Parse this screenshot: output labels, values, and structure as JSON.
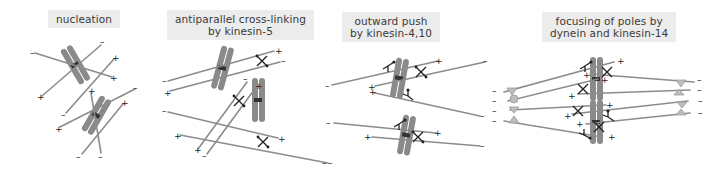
{
  "panels": [
    {
      "id": "nucleation",
      "title_lines": [
        "nucleation"
      ]
    },
    {
      "id": "antiparallel",
      "title_lines": [
        "antiparallel cross-linking",
        "by kinesin-5"
      ]
    },
    {
      "id": "outward",
      "title_lines": [
        "outward push",
        "by kinesin-4,10"
      ]
    },
    {
      "id": "focusing",
      "title_lines": [
        "focusing of poles by",
        "dynein and kinesin-14"
      ]
    }
  ],
  "signs": {
    "plus": "+",
    "minus": "–"
  },
  "colors": {
    "microtubule": "#8c8c8c",
    "chromosome": "#8a8a8a",
    "motor": "#222222",
    "label_bg": "#ececec"
  }
}
